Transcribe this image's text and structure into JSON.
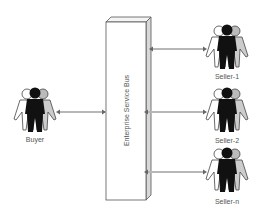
{
  "diagram": {
    "bus": {
      "label": "Enterprise Service Bus"
    },
    "buyer": {
      "label": "Buyer"
    },
    "sellers": [
      {
        "label": "Seller-1"
      },
      {
        "label": "Seller-2"
      },
      {
        "label": "Seller-n"
      }
    ],
    "colors": {
      "bus_front": "#ffffff",
      "bus_side": "#d8d8d8",
      "bus_stroke": "#555555",
      "connector": "#888888",
      "person_dark": "#111111",
      "person_light": "#ffffff",
      "person_gray": "#bbbbbb"
    }
  }
}
